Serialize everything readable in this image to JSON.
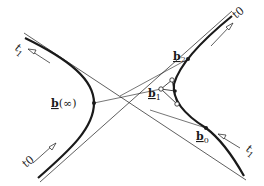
{
  "diagram": {
    "type": "hyperbola-bezier-construction",
    "colors": {
      "ink": "#1a1a1a",
      "background": "#ffffff"
    },
    "labels": {
      "t1_top_left": {
        "base": "t",
        "sub": "1"
      },
      "t0_top_right": {
        "base": "t",
        "sub": "0"
      },
      "t0_bottom_left": {
        "base": "t",
        "sub": "0"
      },
      "t1_bottom_right": {
        "base": "t",
        "sub": "1"
      },
      "b_inf": {
        "base": "b",
        "suffix": "(∞)"
      },
      "b1": {
        "base": "b",
        "sub": "1"
      },
      "b2": {
        "base": "b",
        "sub": "2"
      },
      "b0": {
        "base": "b",
        "sub": "0"
      }
    },
    "elements": [
      "left hyperbola branch (thick)",
      "right hyperbola branch (thick)",
      "two asymptote lines (thin)",
      "control polygon b0-b1-b2 with open circles",
      "direction arrows along branches"
    ]
  }
}
